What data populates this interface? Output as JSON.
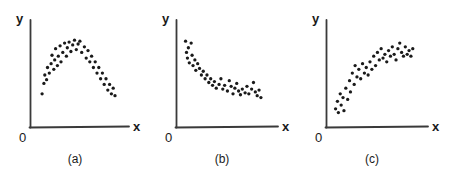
{
  "figure": {
    "background_color": "#ffffff",
    "ink_color": "#1a1a1a",
    "axis_color": "#333333",
    "point_color": "#1a1a1a"
  },
  "panels": [
    {
      "id": "a",
      "caption": "(a)",
      "x_axis_label": "x",
      "y_axis_label": "y",
      "origin_label": "0"
    },
    {
      "id": "b",
      "caption": "(b)",
      "x_axis_label": "x",
      "y_axis_label": "y",
      "origin_label": "0"
    },
    {
      "id": "c",
      "caption": "(c)",
      "x_axis_label": "x",
      "y_axis_label": "y",
      "origin_label": "0"
    }
  ],
  "chart_data": [
    {
      "type": "scatter",
      "title": "(a)",
      "xlabel": "x",
      "ylabel": "y",
      "xlim": [
        0,
        100
      ],
      "ylim": [
        0,
        100
      ],
      "grid": false,
      "legend": null,
      "annotation": "curvilinear inverted-U (quadratic) relationship",
      "points": [
        [
          9,
          30
        ],
        [
          11,
          41
        ],
        [
          12,
          50
        ],
        [
          14,
          45
        ],
        [
          15,
          58
        ],
        [
          17,
          52
        ],
        [
          19,
          62
        ],
        [
          20,
          71
        ],
        [
          22,
          56
        ],
        [
          23,
          66
        ],
        [
          24,
          78
        ],
        [
          26,
          60
        ],
        [
          27,
          70
        ],
        [
          29,
          81
        ],
        [
          30,
          64
        ],
        [
          32,
          74
        ],
        [
          34,
          84
        ],
        [
          36,
          70
        ],
        [
          37,
          79
        ],
        [
          39,
          85
        ],
        [
          41,
          75
        ],
        [
          43,
          82
        ],
        [
          45,
          87
        ],
        [
          47,
          77
        ],
        [
          49,
          83
        ],
        [
          51,
          86
        ],
        [
          53,
          74
        ],
        [
          56,
          80
        ],
        [
          58,
          68
        ],
        [
          60,
          76
        ],
        [
          62,
          64
        ],
        [
          64,
          70
        ],
        [
          66,
          58
        ],
        [
          68,
          64
        ],
        [
          70,
          52
        ],
        [
          72,
          58
        ],
        [
          74,
          46
        ],
        [
          76,
          52
        ],
        [
          78,
          40
        ],
        [
          80,
          46
        ],
        [
          82,
          34
        ],
        [
          84,
          40
        ],
        [
          86,
          30
        ],
        [
          88,
          36
        ],
        [
          90,
          28
        ]
      ]
    },
    {
      "type": "scatter",
      "title": "(b)",
      "xlabel": "x",
      "ylabel": "y",
      "xlim": [
        0,
        100
      ],
      "ylim": [
        0,
        100
      ],
      "grid": false,
      "legend": null,
      "annotation": "negative decelerating (decreasing) relationship",
      "points": [
        [
          6,
          86
        ],
        [
          7,
          74
        ],
        [
          8,
          68
        ],
        [
          9,
          79
        ],
        [
          10,
          63
        ],
        [
          12,
          84
        ],
        [
          13,
          71
        ],
        [
          14,
          60
        ],
        [
          16,
          66
        ],
        [
          17,
          55
        ],
        [
          19,
          62
        ],
        [
          21,
          57
        ],
        [
          23,
          50
        ],
        [
          25,
          54
        ],
        [
          27,
          46
        ],
        [
          29,
          50
        ],
        [
          31,
          42
        ],
        [
          33,
          46
        ],
        [
          35,
          39
        ],
        [
          37,
          43
        ],
        [
          39,
          36
        ],
        [
          42,
          40
        ],
        [
          44,
          46
        ],
        [
          46,
          35
        ],
        [
          48,
          39
        ],
        [
          51,
          33
        ],
        [
          53,
          44
        ],
        [
          55,
          38
        ],
        [
          57,
          30
        ],
        [
          59,
          36
        ],
        [
          61,
          41
        ],
        [
          63,
          33
        ],
        [
          65,
          29
        ],
        [
          67,
          35
        ],
        [
          70,
          31
        ],
        [
          72,
          38
        ],
        [
          74,
          30
        ],
        [
          77,
          35
        ],
        [
          79,
          42
        ],
        [
          81,
          32
        ],
        [
          83,
          28
        ],
        [
          85,
          34
        ],
        [
          87,
          26
        ]
      ]
    },
    {
      "type": "scatter",
      "title": "(c)",
      "xlabel": "x",
      "ylabel": "y",
      "xlim": [
        0,
        100
      ],
      "ylim": [
        0,
        100
      ],
      "grid": false,
      "legend": null,
      "annotation": "positive decelerating (increasing, leveling-off) relationship",
      "points": [
        [
          6,
          14
        ],
        [
          8,
          22
        ],
        [
          9,
          10
        ],
        [
          11,
          30
        ],
        [
          12,
          18
        ],
        [
          14,
          26
        ],
        [
          15,
          12
        ],
        [
          17,
          36
        ],
        [
          19,
          24
        ],
        [
          21,
          44
        ],
        [
          22,
          32
        ],
        [
          24,
          52
        ],
        [
          26,
          40
        ],
        [
          27,
          60
        ],
        [
          29,
          48
        ],
        [
          31,
          56
        ],
        [
          33,
          46
        ],
        [
          35,
          62
        ],
        [
          37,
          52
        ],
        [
          39,
          58
        ],
        [
          41,
          50
        ],
        [
          43,
          64
        ],
        [
          45,
          56
        ],
        [
          47,
          70
        ],
        [
          49,
          60
        ],
        [
          51,
          74
        ],
        [
          53,
          66
        ],
        [
          55,
          78
        ],
        [
          57,
          68
        ],
        [
          59,
          72
        ],
        [
          61,
          64
        ],
        [
          63,
          76
        ],
        [
          65,
          70
        ],
        [
          67,
          80
        ],
        [
          69,
          72
        ],
        [
          71,
          66
        ],
        [
          73,
          78
        ],
        [
          75,
          84
        ],
        [
          77,
          74
        ],
        [
          79,
          70
        ],
        [
          81,
          80
        ],
        [
          83,
          72
        ],
        [
          85,
          76
        ],
        [
          87,
          70
        ],
        [
          89,
          78
        ]
      ]
    }
  ]
}
